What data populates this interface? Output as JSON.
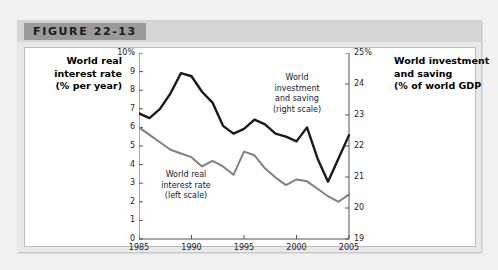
{
  "figure": {
    "tab_label": "FIGURE 22-13"
  },
  "axis_titles": {
    "left": "World real\ninterest rate\n(% per year)",
    "right": "World investment\nand saving\n(% of world GDP"
  },
  "annotations": {
    "rate": "World real\ninterest rate\n(left scale)",
    "investment": "World\ninvestment\nand saving\n(right scale)"
  },
  "colors": {
    "interest_rate_line": "#808080",
    "investment_line": "#1a1a1a",
    "axis": "#555555",
    "page_background": "#f2f2f2",
    "header_band": "#d5d5d5",
    "tab": "#9a9a9a",
    "plot_background": "#ffffff"
  },
  "chart_data": {
    "type": "line",
    "title": "FIGURE 22-13",
    "xlabel": "",
    "ylabel": "World real interest rate (% per year)",
    "y2label": "World investment and saving (% of world GDP",
    "xlim": [
      1985,
      2005
    ],
    "ylim": [
      0,
      10
    ],
    "y2lim": [
      19,
      25
    ],
    "grid": false,
    "legend_position": "inline-annotations",
    "x_ticks": [
      "1985",
      "1990",
      "1995",
      "2000",
      "2005"
    ],
    "y_ticks": [
      "0",
      "1",
      "2",
      "3",
      "4",
      "5",
      "6",
      "7",
      "8",
      "9",
      "10%"
    ],
    "y2_ticks": [
      "19",
      "20",
      "21",
      "22",
      "23",
      "24",
      "25%"
    ],
    "x": [
      1985,
      1986,
      1987,
      1988,
      1989,
      1990,
      1991,
      1992,
      1993,
      1994,
      1995,
      1996,
      1997,
      1998,
      1999,
      2000,
      2001,
      2002,
      2003,
      2004,
      2005
    ],
    "series": [
      {
        "name": "World real interest rate (left scale)",
        "axis": "left",
        "color": "#808080",
        "units": "% per year",
        "values": [
          6.0,
          5.6,
          5.2,
          4.8,
          4.6,
          4.4,
          3.9,
          4.2,
          3.9,
          3.45,
          4.7,
          4.5,
          3.8,
          3.3,
          2.9,
          3.2,
          3.1,
          2.7,
          2.3,
          2.0,
          2.4
        ]
      },
      {
        "name": "World investment and saving (right scale)",
        "axis": "right",
        "color": "#1a1a1a",
        "units": "% of world GDP",
        "values": [
          23.05,
          22.9,
          23.2,
          23.7,
          24.35,
          24.25,
          23.75,
          23.4,
          22.65,
          22.4,
          22.55,
          22.85,
          22.7,
          22.4,
          22.3,
          22.15,
          22.6,
          21.6,
          20.85,
          21.6,
          22.35
        ]
      }
    ]
  }
}
